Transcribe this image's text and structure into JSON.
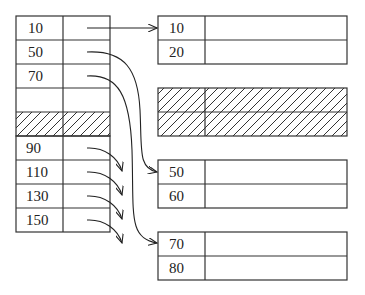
{
  "diagram": {
    "type": "hash-index-buckets",
    "colors": {
      "stroke": "#333333",
      "text": "#222222",
      "background": "#ffffff"
    },
    "root_index": {
      "keys": [
        "10",
        "50",
        "70"
      ],
      "has_hatched_free_row": true
    },
    "overflow_index": {
      "keys": [
        "90",
        "110",
        "130",
        "150"
      ]
    },
    "blocks": [
      {
        "id": "block-1",
        "keys": [
          "10",
          "20"
        ]
      },
      {
        "id": "block-hatched",
        "keys": [
          "",
          ""
        ],
        "hatched": true
      },
      {
        "id": "block-2",
        "keys": [
          "50",
          "60"
        ]
      },
      {
        "id": "block-3",
        "keys": [
          "70",
          "80"
        ]
      }
    ],
    "pointers": [
      {
        "from": "10",
        "to": "block-1"
      },
      {
        "from": "50",
        "to": "block-2"
      },
      {
        "from": "70",
        "to": "block-3"
      },
      {
        "from": "90",
        "to": "offscreen"
      },
      {
        "from": "110",
        "to": "offscreen"
      },
      {
        "from": "130",
        "to": "offscreen"
      },
      {
        "from": "150",
        "to": "offscreen"
      }
    ]
  }
}
